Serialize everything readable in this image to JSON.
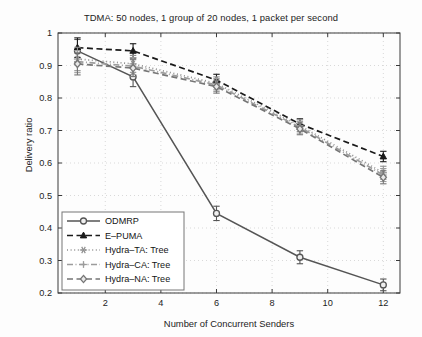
{
  "chart_data": {
    "type": "line",
    "title": "TDMA: 50 nodes, 1 group of 20 nodes, 1 packet per second",
    "xlabel": "Number of Concurrent Senders",
    "ylabel": "Delivery ratio",
    "x": [
      1,
      3,
      6,
      9,
      12
    ],
    "xlim": [
      0.3,
      12.6
    ],
    "ylim": [
      0.2,
      1.0
    ],
    "xticks": [
      2,
      4,
      6,
      8,
      10,
      12
    ],
    "xtick_labels": [
      "2",
      "4",
      "6",
      "8",
      "10",
      "12"
    ],
    "yticks": [
      0.2,
      0.3,
      0.4,
      0.5,
      0.6,
      0.7,
      0.8,
      0.9,
      1.0
    ],
    "ytick_labels": [
      "0.2",
      "0.3",
      "0.4",
      "0.5",
      "0.6",
      "0.7",
      "0.8",
      "0.9",
      "1"
    ],
    "grid": true,
    "grid_style": "dotted",
    "legend_position": "lower-left",
    "errorbars": true,
    "series": [
      {
        "name": "ODMRP",
        "linestyle": "solid",
        "marker": "circle",
        "color": "#555555",
        "values": [
          0.945,
          0.865,
          0.445,
          0.31,
          0.225
        ],
        "errors": [
          0.035,
          0.03,
          0.022,
          0.02,
          0.018
        ]
      },
      {
        "name": "E-PUMA",
        "linestyle": "dashed",
        "marker": "triangle",
        "color": "#1a1a1a",
        "values": [
          0.955,
          0.945,
          0.855,
          0.72,
          0.62
        ],
        "errors": [
          0.03,
          0.022,
          0.018,
          0.016,
          0.016
        ]
      },
      {
        "name": "Hydra-TA: Tree",
        "linestyle": "dotted",
        "marker": "star",
        "color": "#8f8f8f",
        "values": [
          0.92,
          0.905,
          0.845,
          0.715,
          0.57
        ],
        "errors": [
          0.036,
          0.026,
          0.02,
          0.018,
          0.02
        ]
      },
      {
        "name": "Hydra-CA: Tree",
        "linestyle": "dashdot",
        "marker": "plus",
        "color": "#9c9c9c",
        "values": [
          0.912,
          0.898,
          0.84,
          0.71,
          0.563
        ],
        "errors": [
          0.034,
          0.026,
          0.02,
          0.018,
          0.02
        ]
      },
      {
        "name": "Hydra-NA: Tree",
        "linestyle": "dashed",
        "marker": "diamond",
        "color": "#767676",
        "values": [
          0.905,
          0.892,
          0.835,
          0.705,
          0.556
        ],
        "errors": [
          0.034,
          0.026,
          0.02,
          0.018,
          0.02
        ]
      }
    ]
  },
  "legend": {
    "items": [
      {
        "label": "ODMRP"
      },
      {
        "label": "E–PUMA"
      },
      {
        "label": "Hydra–TA: Tree"
      },
      {
        "label": "Hydra–CA: Tree"
      },
      {
        "label": "Hydra–NA: Tree"
      }
    ]
  }
}
